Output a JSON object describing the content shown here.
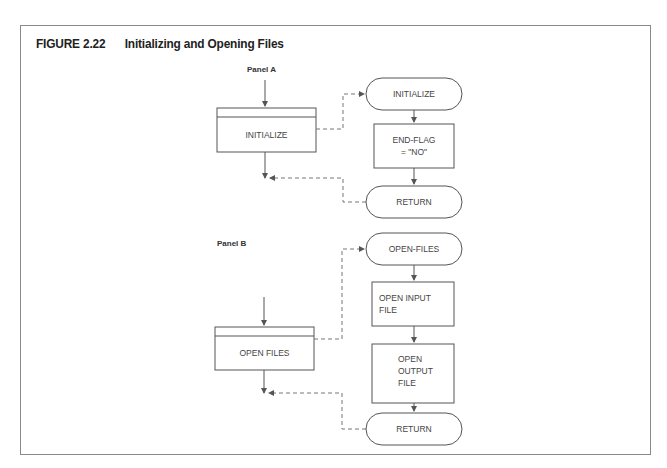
{
  "figure": {
    "number": "FIGURE 2.22",
    "title": "Initializing and Opening Files"
  },
  "panel_a": {
    "label": "Panel A",
    "module_box": "INITIALIZE",
    "flow": {
      "start": "INITIALIZE",
      "steps": [
        [
          "END-FLAG",
          "= \"NO\""
        ]
      ],
      "end": "RETURN"
    }
  },
  "panel_b": {
    "label": "Panel B",
    "module_box": "OPEN FILES",
    "flow": {
      "start": "OPEN-FILES",
      "steps": [
        [
          "OPEN INPUT",
          "FILE"
        ],
        [
          "OPEN",
          "OUTPUT",
          "FILE"
        ]
      ],
      "end": "RETURN"
    }
  },
  "colors": {
    "line": "#555555",
    "dashed": "#777777",
    "frame": "#8a8a8a"
  }
}
